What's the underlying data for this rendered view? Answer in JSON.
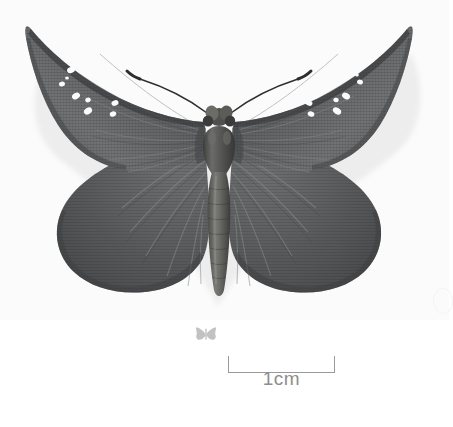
{
  "image": {
    "subject": "pinned butterfly specimen",
    "background_color": "#ffffff",
    "wing_color": "#595b5d",
    "wing_dark_color": "#3f4143",
    "wing_light_color": "#7c7e80",
    "body_color": "#4a4a4a",
    "spot_color": "#ffffff",
    "antenna_color": "#2e2e2e",
    "shadow_color": "#dedede"
  },
  "specimen": {
    "label": "butterfly-dorsal-view",
    "forewing_spots_left_count": 6,
    "forewing_spots_right_count": 6,
    "antennae_count": 2
  },
  "scale_icon": {
    "label": "butterfly-silhouette",
    "color": "#bfbfbf"
  },
  "scale_bar": {
    "label": "1cm",
    "length_px": 107,
    "line_color": "#9a9a9a",
    "text_color": "#8e8e8e"
  }
}
